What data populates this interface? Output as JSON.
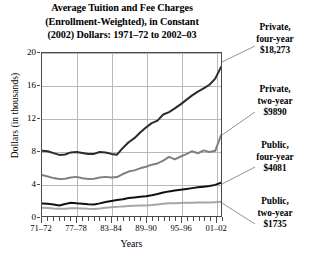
{
  "title": {
    "line1": "Average Tuition and Fee Charges",
    "line2": "(Enrollment-Weighted), in Constant",
    "line3": "(2002) Dollars: 1971–72 to 2002–03"
  },
  "axis": {
    "ylabel": "Dollars (in thousands)",
    "xlabel": "Years",
    "yticks": [
      "0",
      "4",
      "8",
      "12",
      "16",
      "20"
    ],
    "xticks": [
      "71–72",
      "77–78",
      "83–84",
      "89–90",
      "95–96",
      "01–02"
    ]
  },
  "annotations": [
    {
      "name": "private-four-year",
      "line1": "Private,",
      "line2": "four-year",
      "value": "$18,273"
    },
    {
      "name": "private-two-year",
      "line1": "Private,",
      "line2": "two-year",
      "value": "$9890"
    },
    {
      "name": "public-four-year",
      "line1": "Public,",
      "line2": "four-year",
      "value": "$4081"
    },
    {
      "name": "public-two-year",
      "line1": "Public,",
      "line2": "two-year",
      "value": "$1735"
    }
  ],
  "colors": {
    "private_four_year": "#2b2b2b",
    "private_two_year": "#808080",
    "public_four_year": "#111111",
    "public_two_year": "#a6a6a6",
    "grid": "#b9b9b9",
    "frame": "#4a4a4a"
  },
  "chart_data": {
    "type": "line",
    "title": "Average Tuition and Fee Charges (Enrollment-Weighted), in Constant (2002) Dollars: 1971–72 to 2002–03",
    "xlabel": "Years",
    "ylabel": "Dollars (in thousands)",
    "xlim": [
      1971,
      2002
    ],
    "ylim": [
      0,
      20
    ],
    "yticks": [
      0,
      4,
      8,
      12,
      16,
      20
    ],
    "xtick_values": [
      1971,
      1977,
      1983,
      1989,
      1995,
      2001
    ],
    "xtick_labels": [
      "71–72",
      "77–78",
      "83–84",
      "89–90",
      "95–96",
      "01–02"
    ],
    "grid": true,
    "legend": "right-side annotations",
    "units": "thousands of constant 2002 dollars",
    "x": [
      1971,
      1972,
      1973,
      1974,
      1975,
      1976,
      1977,
      1978,
      1979,
      1980,
      1981,
      1982,
      1983,
      1984,
      1985,
      1986,
      1987,
      1988,
      1989,
      1990,
      1991,
      1992,
      1993,
      1994,
      1995,
      1996,
      1997,
      1998,
      1999,
      2000,
      2001,
      2002
    ],
    "series": [
      {
        "name": "Private, four-year",
        "final_label": "$18,273",
        "final_value": 18.273,
        "color": "#2b2b2b",
        "values": [
          8.02,
          7.95,
          7.72,
          7.5,
          7.55,
          7.8,
          7.85,
          7.72,
          7.6,
          7.62,
          7.85,
          7.8,
          7.62,
          7.52,
          8.35,
          9.05,
          9.55,
          10.25,
          10.85,
          11.4,
          11.7,
          12.45,
          12.75,
          13.2,
          13.7,
          14.25,
          14.8,
          15.25,
          15.65,
          16.1,
          16.85,
          18.27
        ]
      },
      {
        "name": "Private, two-year",
        "final_label": "$9890",
        "final_value": 9.89,
        "color": "#808080",
        "values": [
          5.05,
          4.85,
          4.65,
          4.55,
          4.58,
          4.72,
          4.8,
          4.62,
          4.55,
          4.58,
          4.72,
          4.8,
          4.72,
          4.78,
          5.15,
          5.45,
          5.6,
          5.85,
          6.05,
          6.3,
          6.45,
          6.8,
          7.25,
          6.95,
          7.3,
          7.6,
          7.95,
          7.7,
          8.05,
          7.85,
          8.0,
          9.89
        ]
      },
      {
        "name": "Public, four-year",
        "final_label": "$4081",
        "final_value": 4.081,
        "color": "#111111",
        "values": [
          1.52,
          1.5,
          1.42,
          1.3,
          1.48,
          1.62,
          1.55,
          1.5,
          1.45,
          1.42,
          1.55,
          1.72,
          1.85,
          1.95,
          2.05,
          2.2,
          2.28,
          2.35,
          2.42,
          2.55,
          2.7,
          2.88,
          3.02,
          3.12,
          3.22,
          3.32,
          3.42,
          3.52,
          3.6,
          3.68,
          3.82,
          4.08
        ]
      },
      {
        "name": "Public, two-year",
        "final_label": "$1735",
        "final_value": 1.735,
        "color": "#a6a6a6",
        "values": [
          1.02,
          0.98,
          0.92,
          0.88,
          0.9,
          0.95,
          0.95,
          0.92,
          0.88,
          0.86,
          0.92,
          1.02,
          1.08,
          1.12,
          1.18,
          1.22,
          1.25,
          1.28,
          1.3,
          1.34,
          1.42,
          1.5,
          1.56,
          1.58,
          1.6,
          1.62,
          1.64,
          1.65,
          1.66,
          1.67,
          1.7,
          1.74
        ]
      }
    ]
  }
}
